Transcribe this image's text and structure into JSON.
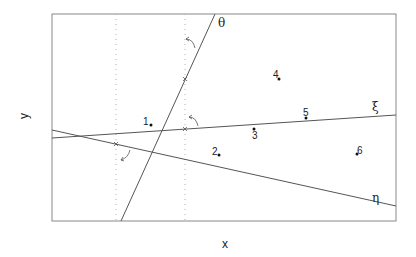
{
  "axes": {
    "xlabel": "x",
    "ylabel": "y"
  },
  "lines": [
    {
      "name": "theta",
      "label": "θ"
    },
    {
      "name": "xi",
      "label": "ξ"
    },
    {
      "name": "eta",
      "label": "η"
    }
  ],
  "points": [
    {
      "label": "1"
    },
    {
      "label": "2"
    },
    {
      "label": "3"
    },
    {
      "label": "4"
    },
    {
      "label": "5"
    },
    {
      "label": "6"
    }
  ],
  "colors": {
    "line": "#555555",
    "frame": "#777777",
    "dotted": "#aaaaaa",
    "point": "#111111"
  }
}
